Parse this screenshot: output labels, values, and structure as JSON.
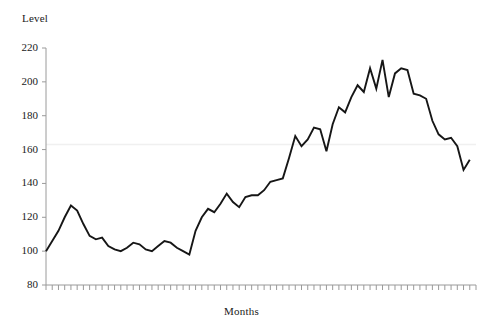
{
  "chart_data": {
    "type": "line",
    "title": "",
    "xlabel": "Months",
    "ylabel": "Level",
    "ylim": [
      80,
      220
    ],
    "yticks": [
      80,
      100,
      120,
      140,
      160,
      180,
      200,
      220
    ],
    "ytick_labels": [
      "80",
      "100",
      "120",
      "140",
      "160",
      "180",
      "200",
      "220"
    ],
    "xlim": [
      0,
      69
    ],
    "xticks_count": 70,
    "xtick_labels": [],
    "grid": "single faint horizontal reference line at 163",
    "reference_line_value": 163,
    "legend": "none",
    "line_color": "#161616",
    "line_width": 1.9,
    "series": [
      {
        "name": "Level",
        "values": [
          100,
          106,
          112,
          120,
          127,
          124,
          116,
          109,
          107,
          108,
          103,
          101,
          100,
          102,
          105,
          104,
          101,
          100,
          103,
          106,
          105,
          102,
          100,
          98,
          112,
          120,
          125,
          123,
          128,
          134,
          129,
          126,
          132,
          133,
          133,
          136,
          141,
          142,
          143,
          155,
          168,
          162,
          166,
          173,
          172,
          159,
          175,
          185,
          182,
          191,
          198,
          194,
          208,
          196,
          213,
          191,
          205,
          208,
          207,
          193,
          192,
          190,
          177,
          169,
          166,
          167,
          162,
          148,
          154
        ]
      }
    ]
  },
  "axis": {
    "y_title": "Level",
    "x_title": "Months"
  }
}
